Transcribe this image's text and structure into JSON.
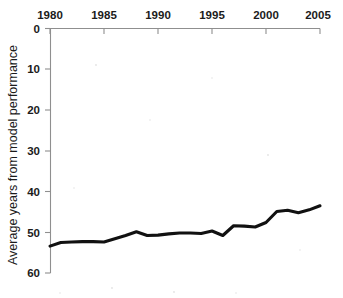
{
  "chart_data": {
    "type": "line",
    "title": "",
    "subtitle": "",
    "xlabel": "",
    "ylabel": "Average years from model performance",
    "xlim": [
      1980,
      2005
    ],
    "ylim": [
      0,
      60
    ],
    "y_axis_inverted": true,
    "grid": false,
    "legend": null,
    "x_ticks": [
      1980,
      1985,
      1990,
      1995,
      2000,
      2005
    ],
    "x_tick_labels": [
      "1980",
      "1985",
      "1990",
      "1995",
      "2000",
      "2005"
    ],
    "x_axis_position": "top",
    "y_ticks": [
      0,
      10,
      20,
      30,
      40,
      50,
      60
    ],
    "y_tick_labels": [
      "0",
      "10",
      "20",
      "30",
      "40",
      "50",
      "60"
    ],
    "y_axis_position": "left",
    "line_color": "#111111",
    "x": [
      1980,
      1981,
      1982,
      1983,
      1984,
      1985,
      1986,
      1987,
      1988,
      1989,
      1990,
      1991,
      1992,
      1993,
      1994,
      1995,
      1996,
      1997,
      1998,
      1999,
      2000,
      2001,
      2002,
      2003,
      2004,
      2005
    ],
    "values": [
      53.4,
      52.5,
      52.4,
      52.3,
      52.3,
      52.4,
      51.6,
      50.8,
      49.9,
      50.8,
      50.7,
      50.4,
      50.2,
      50.2,
      50.3,
      49.7,
      50.8,
      48.4,
      48.5,
      48.7,
      47.6,
      44.9,
      44.6,
      45.2,
      44.5,
      43.5
    ],
    "series": [
      {
        "name": "Average years from model performance",
        "values": [
          53.4,
          52.5,
          52.4,
          52.3,
          52.3,
          52.4,
          51.6,
          50.8,
          49.9,
          50.8,
          50.7,
          50.4,
          50.2,
          50.2,
          50.3,
          49.7,
          50.8,
          48.4,
          48.5,
          48.7,
          47.6,
          44.9,
          44.6,
          45.2,
          44.5,
          43.5
        ]
      }
    ]
  },
  "axis": {
    "y_title": "Average years from model performance",
    "x_tick_1": "1980",
    "x_tick_2": "1985",
    "x_tick_3": "1990",
    "x_tick_4": "1995",
    "x_tick_5": "2000",
    "x_tick_6": "2005",
    "y_tick_1": "0",
    "y_tick_2": "10",
    "y_tick_3": "20",
    "y_tick_4": "30",
    "y_tick_5": "40",
    "y_tick_6": "50",
    "y_tick_7": "60"
  }
}
